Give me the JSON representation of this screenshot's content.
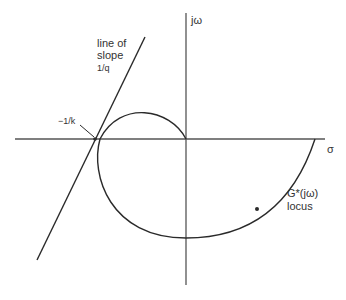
{
  "diagram": {
    "axes": {
      "real_axis_label": "σ",
      "imag_axis_label": "jω"
    },
    "slope_line": {
      "label_line1": "line of",
      "label_line2": "slope",
      "label_line3": "1/q"
    },
    "intersection_label": "−1/k",
    "locus": {
      "label_line1": "G*(jω)",
      "label_line2": "locus"
    },
    "colors": {
      "stroke": "#2a2a2a",
      "axis": "#555555"
    }
  }
}
